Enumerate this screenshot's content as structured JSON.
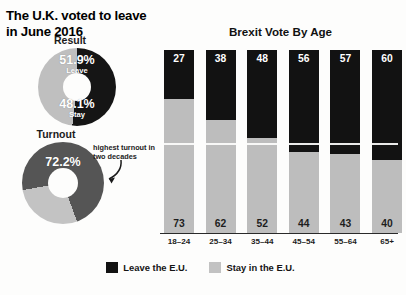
{
  "headline": "The U.K. voted to leave in June 2016",
  "donuts": [
    {
      "title": "Result",
      "slices": [
        {
          "label": "Leave",
          "value": 51.9,
          "value_text": "51.9%",
          "color": "#151515"
        },
        {
          "label": "Stay",
          "value": 48.1,
          "value_text": "48.1%",
          "color": "#bfbfbf"
        }
      ]
    },
    {
      "title": "Turnout",
      "slices": [
        {
          "label": "",
          "value": 72.2,
          "value_text": "72.2%",
          "color": "#555555"
        },
        {
          "label": "",
          "value": 27.8,
          "value_text": "",
          "color": "#c3c3c3"
        }
      ]
    }
  ],
  "annotation": {
    "text": "highest turnout in two decades",
    "arrow_icon": "curved-arrow-icon"
  },
  "chart_data": {
    "type": "bar",
    "title": "Brexit Vote By Age",
    "xlabel": "",
    "ylabel": "",
    "ylim": [
      0,
      100
    ],
    "grid": false,
    "stacked": true,
    "stack_order": "leave-top",
    "legend_position": "bottom",
    "categories": [
      "18–24",
      "25–34",
      "35–44",
      "45–54",
      "55–64",
      "65+"
    ],
    "series": [
      {
        "name": "Leave the E.U.",
        "color": "#121212",
        "values": [
          27,
          38,
          48,
          56,
          57,
          60
        ]
      },
      {
        "name": "Stay in the E.U.",
        "color": "#bdbdbd",
        "values": [
          73,
          62,
          52,
          44,
          43,
          40
        ]
      }
    ],
    "annotations": [
      {
        "text": "highest turnout in two decades",
        "target": "turnout-donut"
      }
    ]
  },
  "legend": [
    {
      "label": "Leave the E.U.",
      "color": "#121212"
    },
    {
      "label": "Stay in the E.U.",
      "color": "#c2c2c2"
    }
  ],
  "colors": {
    "leave": "#121212",
    "stay": "#bdbdbd",
    "turnout": "#555555",
    "turnout_remainder": "#c3c3c3",
    "background": "#fdfdfc",
    "text": "#111111"
  }
}
